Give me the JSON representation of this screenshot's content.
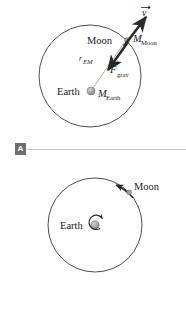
{
  "figure": {
    "background_color": "#ffffff",
    "stroke_color": "#3a3a3a",
    "body_color": "#9a9a9a",
    "arrow_color": "#2b2b2b",
    "rule_color": "#c9c9c9",
    "key_background": "#6e6e6e",
    "key_text_color": "#ffffff"
  },
  "panel_a": {
    "key": "A",
    "orbit": {
      "center_x": 90,
      "center_y": 76,
      "radius": 51
    },
    "earth": {
      "label": "Earth",
      "mass_symbol": "M",
      "mass_subscript": "Earth",
      "x": 91,
      "y": 91,
      "radius": 4
    },
    "moon": {
      "label": "Moon",
      "mass_symbol": "M",
      "mass_subscript": "Moon",
      "x": 127,
      "y": 40,
      "radius": 2.4
    },
    "radius_label": {
      "symbol": "r",
      "subscript": "EM"
    },
    "velocity_vector": {
      "symbol": "v",
      "label": "v",
      "direction_deg": -45,
      "length": 26
    },
    "gravity_vector": {
      "symbol": "F",
      "subscript": "grav",
      "label": "F",
      "direction_deg": 135,
      "length": 26
    }
  },
  "panel_b": {
    "key": "B",
    "orbit": {
      "center_x": 95,
      "center_y": 225,
      "radius": 47
    },
    "earth": {
      "label": "Earth",
      "x": 95,
      "y": 225,
      "radius": 4
    },
    "moon": {
      "label": "Moon",
      "x": 129,
      "y": 192,
      "radius": 2.4
    },
    "orbit_arrow": {
      "name": "orbital-direction-arrow",
      "direction": "counterclockwise"
    },
    "spin_arrow": {
      "name": "earth-rotation-arrow",
      "direction": "counterclockwise"
    }
  }
}
